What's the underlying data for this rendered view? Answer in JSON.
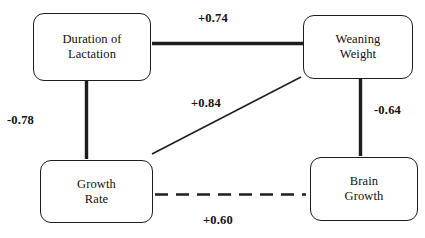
{
  "diagram": {
    "type": "path-diagram",
    "nodes": [
      {
        "id": "duration-of-lactation",
        "label": "Duration of\nLactation"
      },
      {
        "id": "weaning-weight",
        "label": "Weaning\nWeight"
      },
      {
        "id": "growth-rate",
        "label": "Growth\nRate"
      },
      {
        "id": "brain-growth",
        "label": "Brain\nGrowth"
      }
    ],
    "edges": [
      {
        "id": "lactation-weaning",
        "from": "duration-of-lactation",
        "to": "weaning-weight",
        "label": "+0.74",
        "style": "thick-solid"
      },
      {
        "id": "lactation-growth",
        "from": "duration-of-lactation",
        "to": "growth-rate",
        "label": "-0.78",
        "style": "thick-solid"
      },
      {
        "id": "growth-weaning",
        "from": "growth-rate",
        "to": "weaning-weight",
        "label": "+0.84",
        "style": "thin-solid"
      },
      {
        "id": "weaning-brain",
        "from": "weaning-weight",
        "to": "brain-growth",
        "label": "-0.64",
        "style": "thick-solid"
      },
      {
        "id": "growth-brain",
        "from": "growth-rate",
        "to": "brain-growth",
        "label": "+0.60",
        "style": "dashed"
      }
    ],
    "colors": {
      "line": "#211d1c",
      "text": "#14100f",
      "background": "#ffffff"
    }
  }
}
